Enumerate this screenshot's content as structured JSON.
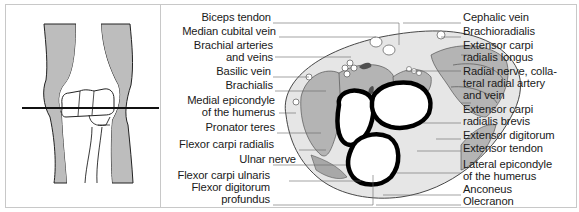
{
  "figure": {
    "sketch_title": "Elbow joint anterior view with transverse section line",
    "labels_left": [
      {
        "id": "biceps_tendon",
        "text": "Biceps tendon",
        "top": 12
      },
      {
        "id": "median_cubital_vein",
        "text": "Median cubital vein",
        "top": 26
      },
      {
        "id": "brachial_arteries_1",
        "text": "Brachial arteries",
        "top": 40
      },
      {
        "id": "brachial_arteries_2",
        "text": "and veins",
        "top": 52
      },
      {
        "id": "basilic_vein",
        "text": "Basilic vein",
        "top": 66
      },
      {
        "id": "brachialis",
        "text": "Brachialis",
        "top": 80
      },
      {
        "id": "medial_epicondyle_1",
        "text": "Medial epicondyle",
        "top": 95
      },
      {
        "id": "medial_epicondyle_2",
        "text": "of the humerus",
        "top": 107
      },
      {
        "id": "pronator_teres",
        "text": "Pronator teres",
        "top": 122
      },
      {
        "id": "flexor_carpi_radialis",
        "text": "Flexor carpi radialis",
        "top": 139
      },
      {
        "id": "ulnar_nerve",
        "text": "Ulnar nerve",
        "top": 154
      },
      {
        "id": "flexor_carpi_ulnaris",
        "text": "Flexor carpi ulnaris",
        "top": 170
      },
      {
        "id": "flexor_digitorum_1",
        "text": "Flexor digitorum",
        "top": 182
      },
      {
        "id": "flexor_digitorum_2",
        "text": "profundus",
        "top": 194
      }
    ],
    "labels_right": [
      {
        "id": "cephalic_vein",
        "text": "Cephalic vein",
        "top": 12
      },
      {
        "id": "brachioradialis",
        "text": "Brachioradialis",
        "top": 26
      },
      {
        "id": "ecrl_1",
        "text": "Extensor carpi",
        "top": 40
      },
      {
        "id": "ecrl_2",
        "text": "radialis longus",
        "top": 52
      },
      {
        "id": "radial_nerve_1",
        "text": "Radial nerve, colla-",
        "top": 66
      },
      {
        "id": "radial_nerve_2",
        "text": "teral radial artery",
        "top": 78
      },
      {
        "id": "radial_nerve_3",
        "text": "and vein",
        "top": 90
      },
      {
        "id": "ecrb_1",
        "text": "Extensor carpi",
        "top": 104
      },
      {
        "id": "ecrb_2",
        "text": "radialis brevis",
        "top": 116
      },
      {
        "id": "extensor_digitorum",
        "text": "Extensor digitorum",
        "top": 130
      },
      {
        "id": "extensor_tendon",
        "text": "Extensor tendon",
        "top": 143
      },
      {
        "id": "lateral_epicondyle_1",
        "text": "Lateral epicondyle",
        "top": 159
      },
      {
        "id": "lateral_epicondyle_2",
        "text": "of the humerus",
        "top": 171
      },
      {
        "id": "anconeus",
        "text": "Anconeus",
        "top": 184
      },
      {
        "id": "olecranon",
        "text": "Olecranon",
        "top": 196
      }
    ],
    "colors": {
      "muscle": "#b4b4b4",
      "subcutaneous": "#e6e6e6",
      "bone_outline": "#000000",
      "vessel_dark": "#505050",
      "frame": "#c8c8c8"
    }
  }
}
